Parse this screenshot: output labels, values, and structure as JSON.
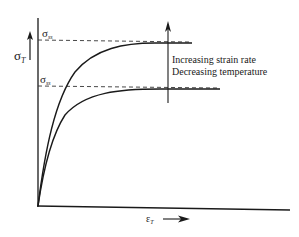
{
  "diagram": {
    "y_axis_label": "σ",
    "y_axis_sub": "T",
    "x_axis_label": "ε",
    "x_axis_sub": "T",
    "upper_plateau_label": "σ",
    "upper_plateau_sub": "ss",
    "lower_plateau_label": "σ",
    "lower_plateau_sub": "ss",
    "annotation_line1": "Increasing strain rate",
    "annotation_line2": "Decreasing temperature",
    "curves": [
      {
        "name": "upper-curve",
        "description": "high strain rate / low temperature",
        "plateau": "upper"
      },
      {
        "name": "lower-curve",
        "description": "low strain rate / high temperature",
        "plateau": "lower"
      }
    ],
    "colors": {
      "line": "#1a1a1a",
      "dashed": "#333333",
      "background": "#ffffff"
    }
  }
}
